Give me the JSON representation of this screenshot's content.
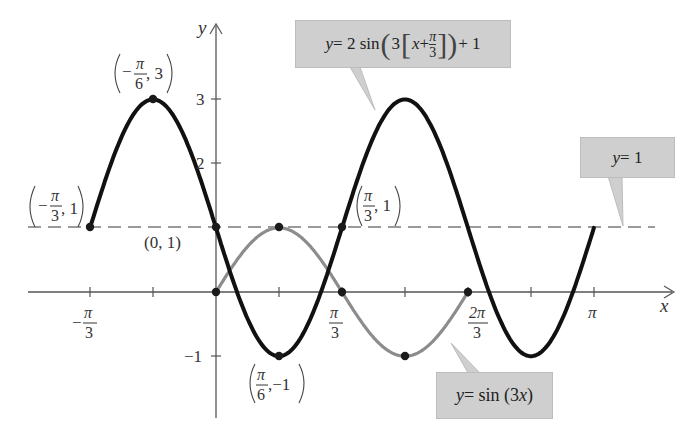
{
  "chart_data": {
    "type": "line",
    "title": "",
    "xlabel": "x",
    "ylabel": "y",
    "xlim_radians": [
      -1.5,
      3.8
    ],
    "ylim": [
      -2.0,
      4.5
    ],
    "x_ticks": [
      {
        "value": -1.0472,
        "label": "-π/3"
      },
      {
        "value": -0.5236,
        "label": ""
      },
      {
        "value": 0.5236,
        "label": ""
      },
      {
        "value": 1.0472,
        "label": "π/3"
      },
      {
        "value": 1.5708,
        "label": ""
      },
      {
        "value": 2.0944,
        "label": "2π/3"
      },
      {
        "value": 2.618,
        "label": ""
      },
      {
        "value": 3.1416,
        "label": "π"
      }
    ],
    "y_ticks": [
      {
        "value": 3,
        "label": "3"
      },
      {
        "value": 2,
        "label": "2"
      },
      {
        "value": -1,
        "label": "-1"
      }
    ],
    "grid": false,
    "series": [
      {
        "name": "y = 2 sin(3[x + π/3]) + 1",
        "color": "#111111",
        "style": "solid-thick",
        "domain": [
          -1.0472,
          3.1416
        ],
        "formula": "2*sin(3*(x+pi/3))+1"
      },
      {
        "name": "y = sin(3x)",
        "color": "#8a8a8a",
        "style": "solid",
        "domain": [
          0,
          2.0944
        ],
        "formula": "sin(3*x)"
      },
      {
        "name": "y = 1",
        "color": "#777777",
        "style": "dashed",
        "domain": [
          -1.55,
          3.65
        ],
        "formula": "1"
      }
    ],
    "marked_points": [
      {
        "x": "-π/3",
        "y": 1,
        "label": "(-π/3, 1)"
      },
      {
        "x": "-π/6",
        "y": 3,
        "label": "(-π/6, 3)"
      },
      {
        "x": "0",
        "y": 1,
        "label": "(0, 1)"
      },
      {
        "x": "π/6",
        "y": -1,
        "label": "(π/6, -1)"
      },
      {
        "x": "π/3",
        "y": 1,
        "label": "(π/3, 1)"
      },
      {
        "x": "0",
        "y": 0,
        "label": ""
      },
      {
        "x": "π/6",
        "y": 1,
        "label": ""
      },
      {
        "x": "π/3",
        "y": 0,
        "label": ""
      },
      {
        "x": "π/2",
        "y": -1,
        "label": ""
      },
      {
        "x": "2π/3",
        "y": 0,
        "label": ""
      }
    ],
    "annotations": [
      "y = 2 sin(3[x + π/3]) + 1",
      "y = sin(3x)",
      "y = 1"
    ]
  },
  "axes": {
    "x_label": "x",
    "y_label": "y"
  },
  "ticks": {
    "x_neg_pi3_num": "π",
    "x_neg_pi3_den": "3",
    "x_neg_sign": "−",
    "x_pi3_num": "π",
    "x_pi3_den": "3",
    "x_2pi3_num": "2π",
    "x_2pi3_den": "3",
    "x_pi": "π",
    "y_3": "3",
    "y_2": "2",
    "y_neg1": "−1"
  },
  "points": {
    "p1": {
      "sign": "−",
      "num": "π",
      "den": "3",
      "val": ", 1"
    },
    "p2": {
      "sign": "−",
      "num": "π",
      "den": "6",
      "val": ", 3"
    },
    "p3": {
      "text": "(0, 1)"
    },
    "p4": {
      "num": "π",
      "den": "6",
      "val": ",−1"
    },
    "p5": {
      "num": "π",
      "den": "3",
      "val": ", 1"
    }
  },
  "callouts": {
    "transformed": {
      "y": "y",
      "eq": " = 2 sin",
      "three": "3",
      "x": "x",
      "plus": " + ",
      "num": "π",
      "den": "3",
      "tail": " + 1"
    },
    "base": {
      "y": "y",
      "eq": " = sin (3",
      "x": "x",
      "close": ")"
    },
    "midline": {
      "y": "y",
      "eq": " = 1"
    }
  }
}
